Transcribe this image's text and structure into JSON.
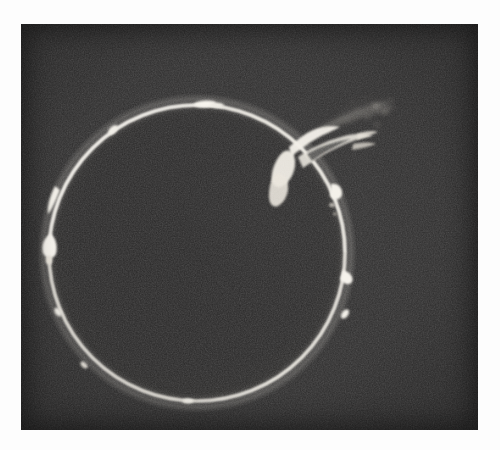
{
  "page": {
    "background_color": "#fdfdfd",
    "width": 500,
    "height": 450
  },
  "plate": {
    "name": "solar-eclipse-photograph",
    "description": "Monochrome astronomical photograph of the totally eclipsed Sun showing the chromospheric ring and solar prominences",
    "frame": {
      "x": 21,
      "y": 24,
      "width": 457,
      "height": 406
    },
    "background_color": "#2b2a2a",
    "limb_color": "#f4f2ee",
    "disk_color": "#262525",
    "is_monochrome": true
  },
  "chart_data": {
    "type": "scatter",
    "title": "",
    "subtitle": "",
    "xlabel": "",
    "ylabel": "",
    "grid": false,
    "legend": null,
    "xlim": [
      0,
      457
    ],
    "ylim": [
      0,
      406
    ],
    "disk": {
      "center_x": 176,
      "center_y": 229,
      "radius": 148,
      "ring_thickness": 2.4,
      "ring_color": "#f4f2ee",
      "interior_color": "#262525"
    },
    "features": [
      {
        "name": "major-arch-prominence",
        "label": "large arched prominence",
        "angle_deg": 42,
        "height_px": 58,
        "brightness": "high",
        "position_x": 288,
        "position_y": 112
      },
      {
        "name": "wispy-streamers",
        "label": "faint outer streamers",
        "angle_deg": 34,
        "height_px": 74,
        "brightness": "low",
        "position_x": 330,
        "position_y": 84
      },
      {
        "name": "top-limb-knot",
        "label": "small bright knot on upper limb",
        "angle_deg": 96,
        "height_px": 5,
        "brightness": "medium",
        "position_x": 184,
        "position_y": 81
      },
      {
        "name": "upper-left-knot",
        "label": "small knot upper-left limb",
        "angle_deg": 127,
        "height_px": 4,
        "brightness": "medium",
        "position_x": 92,
        "position_y": 105
      },
      {
        "name": "left-prominence-upper",
        "label": "left limb prominence",
        "angle_deg": 168,
        "height_px": 8,
        "brightness": "high",
        "position_x": 31,
        "position_y": 176
      },
      {
        "name": "left-prominence-lower",
        "label": "left limb bright node",
        "angle_deg": 186,
        "height_px": 9,
        "brightness": "high",
        "position_x": 28,
        "position_y": 221
      },
      {
        "name": "lower-left-knot",
        "label": "lower-left limb knot",
        "angle_deg": 203,
        "height_px": 5,
        "brightness": "medium",
        "position_x": 36,
        "position_y": 288
      },
      {
        "name": "bottom-left-knot",
        "label": "bottom-left limb knot",
        "angle_deg": 228,
        "height_px": 4,
        "brightness": "low",
        "position_x": 62,
        "position_y": 341
      },
      {
        "name": "bottom-knot",
        "label": "bottom limb bright spot",
        "angle_deg": 267,
        "height_px": 4,
        "brightness": "medium",
        "position_x": 168,
        "position_y": 377
      },
      {
        "name": "lower-right-knot",
        "label": "lower-right limb knot",
        "angle_deg": 311,
        "height_px": 6,
        "brightness": "medium",
        "position_x": 324,
        "position_y": 291
      },
      {
        "name": "right-prominence",
        "label": "right limb prominence",
        "angle_deg": 345,
        "height_px": 7,
        "brightness": "high",
        "position_x": 327,
        "position_y": 252
      },
      {
        "name": "right-upper-knot",
        "label": "upper-right limb knot",
        "angle_deg": 16,
        "height_px": 6,
        "brightness": "medium",
        "position_x": 315,
        "position_y": 167
      }
    ]
  }
}
